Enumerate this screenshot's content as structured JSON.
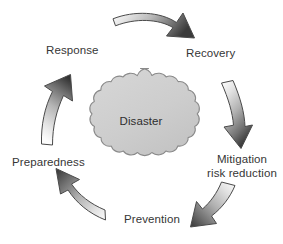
{
  "diagram": {
    "center": {
      "shape": "cloud",
      "label": "Disaster",
      "fill": "#cfcfcf",
      "stroke": "#8d8d8d"
    },
    "labels": {
      "response": "Response",
      "recovery": "Recovery",
      "mitigation_line1": "Mitigation",
      "mitigation_line2": "risk reduction",
      "prevention": "Prevention",
      "preparedness": "Preparedness"
    },
    "arrows": [
      {
        "name": "arrow-response-to-recovery",
        "from": "Response",
        "to": "Recovery",
        "direction": "clockwise",
        "position": "top",
        "points": "right-down",
        "gradient_light": "#f2f2f2",
        "gradient_dark": "#3b3b3b"
      },
      {
        "name": "arrow-recovery-to-mitigation",
        "from": "Recovery",
        "to": "Mitigation risk reduction",
        "direction": "clockwise",
        "position": "right",
        "points": "down",
        "gradient_light": "#f2f2f2",
        "gradient_dark": "#3b3b3b"
      },
      {
        "name": "arrow-mitigation-to-prevention",
        "from": "Mitigation risk reduction",
        "to": "Prevention",
        "direction": "clockwise",
        "position": "bottom-right",
        "points": "down-left",
        "gradient_light": "#f2f2f2",
        "gradient_dark": "#3b3b3b"
      },
      {
        "name": "arrow-prevention-to-preparedness",
        "from": "Prevention",
        "to": "Preparedness",
        "direction": "clockwise",
        "position": "bottom-left",
        "points": "up-left",
        "gradient_light": "#f2f2f2",
        "gradient_dark": "#3b3b3b"
      },
      {
        "name": "arrow-preparedness-to-response",
        "from": "Preparedness",
        "to": "Response",
        "direction": "clockwise",
        "position": "left",
        "points": "up",
        "gradient_light": "#f2f2f2",
        "gradient_dark": "#3b3b3b"
      }
    ],
    "colors": {
      "background": "#ffffff",
      "text": "#363636",
      "cloud_fill": "#cfcfcf",
      "cloud_stroke": "#8d8d8d",
      "arrow_outline": "#4a4a4a"
    }
  }
}
